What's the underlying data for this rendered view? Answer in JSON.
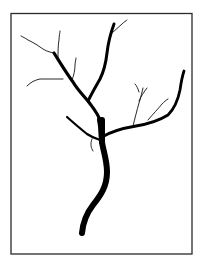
{
  "figure": {
    "colors": {
      "background": "#ffffff",
      "ink": "#000000",
      "frame": "#2a2a2a"
    }
  }
}
